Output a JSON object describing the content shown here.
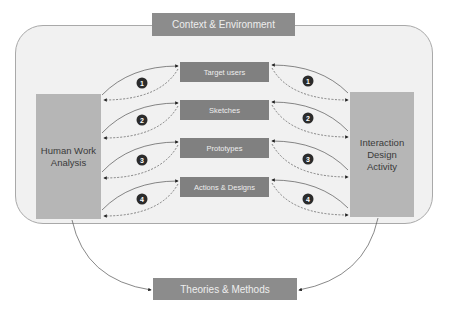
{
  "diagram": {
    "context_label": "Context & Environment",
    "left_box_label": "Human Work Analysis",
    "right_box_label": "Interaction Design Activity",
    "bottom_label": "Theories & Methods",
    "center_items": [
      {
        "label": "Target users",
        "step": "1"
      },
      {
        "label": "Sketches",
        "step": "2"
      },
      {
        "label": "Prototypes",
        "step": "3"
      },
      {
        "label": "Actions & Designs",
        "step": "4"
      }
    ],
    "colors": {
      "outer_fill": "#f1f1f1",
      "outer_border": "#a9a9a9",
      "center_box": "#808080",
      "side_box": "#b6b6b6",
      "badge": "#2b2b2b"
    }
  }
}
